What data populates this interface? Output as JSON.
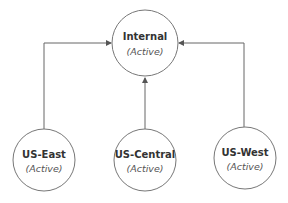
{
  "diagram": {
    "type": "tree",
    "root": {
      "id": "internal",
      "name": "Internal",
      "status": "(Active)"
    },
    "children": [
      {
        "id": "us-east",
        "name": "US-East",
        "status": "(Active)"
      },
      {
        "id": "us-central",
        "name": "US-Central",
        "status": "(Active)"
      },
      {
        "id": "us-west",
        "name": "US-West",
        "status": "(Active)"
      }
    ],
    "edges": [
      {
        "from": "us-east",
        "to": "internal"
      },
      {
        "from": "us-central",
        "to": "internal"
      },
      {
        "from": "us-west",
        "to": "internal"
      }
    ],
    "colors": {
      "line": "#666666",
      "circle_stroke": "#777777",
      "title_text": "#333333",
      "status_text": "#555555"
    }
  }
}
